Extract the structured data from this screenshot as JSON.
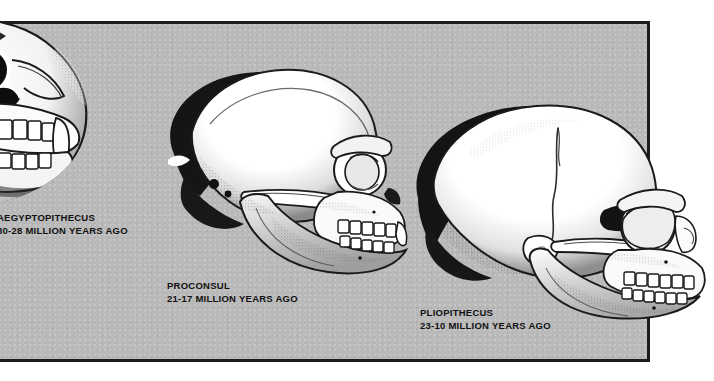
{
  "plate": {
    "width": 714,
    "height": 381,
    "background_color": "#ffffff",
    "panel_color": "#b9b9b9",
    "border_color": "#1c1c1c",
    "ink_color": "#111111",
    "bone_color": "#ffffff"
  },
  "figures": [
    {
      "id": "aegyptopithecus",
      "icon": "skull-icon",
      "name": "AEGYPTOPITHECUS",
      "age": "30-28 MILLION YEARS AGO",
      "view": "three-quarter frontal, cropped at left edge",
      "period_start_mya": 30,
      "period_end_mya": 28
    },
    {
      "id": "proconsul",
      "icon": "skull-icon",
      "name": "PROCONSUL",
      "age": "21-17 MILLION YEARS AGO",
      "view": "right-facing lateral profile",
      "period_start_mya": 21,
      "period_end_mya": 17
    },
    {
      "id": "pliopithecus",
      "icon": "skull-icon",
      "name": "PLIOPITHECUS",
      "age": "23-10 MILLION YEARS AGO",
      "view": "right-facing lateral profile, overflowing panel border",
      "period_start_mya": 23,
      "period_end_mya": 10
    }
  ]
}
